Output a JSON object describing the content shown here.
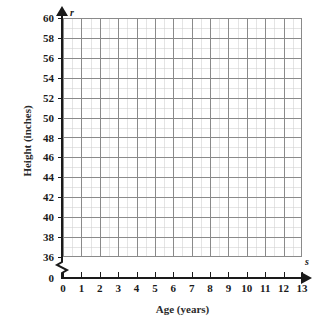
{
  "chart_data": {
    "type": "scatter",
    "title": "",
    "subtitle": "",
    "xlabel": "Age (years)",
    "ylabel": "Height (inches)",
    "x_variable_symbol": "s",
    "y_variable_symbol": "r",
    "x_ticks": [
      "0",
      "1",
      "2",
      "3",
      "4",
      "5",
      "6",
      "7",
      "8",
      "9",
      "10",
      "11",
      "12",
      "13"
    ],
    "y_ticks": [
      "0",
      "36",
      "38",
      "40",
      "42",
      "44",
      "46",
      "48",
      "50",
      "52",
      "54",
      "56",
      "58",
      "60"
    ],
    "x_tick_values": [
      0,
      1,
      2,
      3,
      4,
      5,
      6,
      7,
      8,
      9,
      10,
      11,
      12,
      13
    ],
    "y_tick_values": [
      0,
      36,
      38,
      40,
      42,
      44,
      46,
      48,
      50,
      52,
      54,
      56,
      58,
      60
    ],
    "xlim": [
      0,
      13
    ],
    "ylim": [
      36,
      60
    ],
    "x_tick_step": 1,
    "y_tick_step": 2,
    "y_axis_break": true,
    "y_axis_break_between": [
      0,
      36
    ],
    "grid": true,
    "grid_major_columns": 13,
    "grid_major_rows": 12,
    "grid_minor_subdivisions": 2,
    "legend": "none",
    "series": [],
    "values": [],
    "annotations": [],
    "colors": {
      "axis": "#1a1a1a",
      "grid_major": "#8a8a8a",
      "grid_minor": "#969696",
      "text": "#1a1a1a",
      "title_text": "#2b2b2b",
      "background": "#ffffff"
    }
  }
}
